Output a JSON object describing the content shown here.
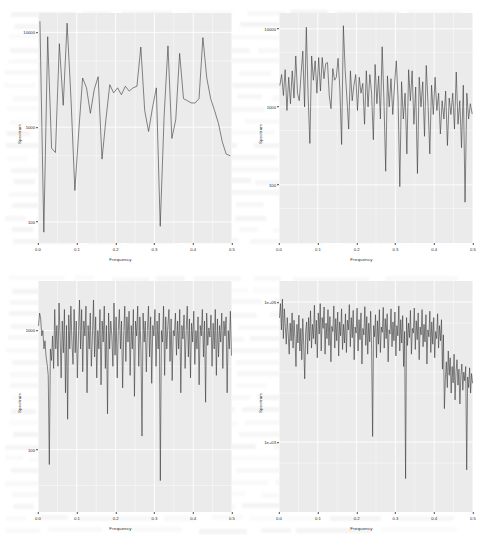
{
  "figure": {
    "kind": "spectrum-panel-grid",
    "rows": 2,
    "columns": 2,
    "page_background": "#ffffff",
    "panel_background": "#ebebeb",
    "gridline_color": "#ffffff",
    "series_color": "#3c3c3c",
    "axis_text_color": "#2b2b2b"
  },
  "chart_data": [
    {
      "id": "panel-top-left",
      "type": "line",
      "title": "",
      "xlabel": "Frequency",
      "ylabel": "Spectrum",
      "yscale": "log",
      "xlim": [
        0.0,
        0.5
      ],
      "ylim": [
        60,
        16000
      ],
      "grid": true,
      "legend": "none",
      "xticks": [
        "0.0",
        "0.1",
        "0.2",
        "0.3",
        "0.4",
        "0.5"
      ],
      "xtick_values": [
        0.0,
        0.1,
        0.2,
        0.3,
        0.4,
        0.5
      ],
      "yticks": [
        "10000",
        "1000",
        "100"
      ],
      "ytick_values": [
        10000,
        1000,
        100
      ],
      "x": [
        0.005,
        0.015,
        0.025,
        0.035,
        0.045,
        0.055,
        0.065,
        0.075,
        0.085,
        0.095,
        0.105,
        0.115,
        0.125,
        0.135,
        0.145,
        0.155,
        0.165,
        0.175,
        0.185,
        0.195,
        0.205,
        0.215,
        0.225,
        0.235,
        0.245,
        0.255,
        0.265,
        0.275,
        0.285,
        0.295,
        0.305,
        0.315,
        0.325,
        0.335,
        0.345,
        0.355,
        0.365,
        0.375,
        0.385,
        0.395,
        0.405,
        0.415,
        0.425,
        0.435,
        0.445,
        0.455,
        0.465,
        0.475,
        0.485,
        0.495
      ],
      "values": [
        13000,
        78,
        9000,
        600,
        540,
        7600,
        1700,
        12500,
        2000,
        215,
        900,
        3300,
        2600,
        1400,
        2500,
        3400,
        460,
        1200,
        2800,
        2300,
        2600,
        2200,
        2700,
        2400,
        2600,
        2700,
        7000,
        1500,
        900,
        1600,
        2600,
        90,
        1300,
        7200,
        760,
        1200,
        6000,
        2000,
        1900,
        1800,
        1800,
        2000,
        8800,
        3300,
        2000,
        1500,
        1100,
        700,
        520,
        500
      ]
    },
    {
      "id": "panel-top-right",
      "type": "line",
      "title": "",
      "xlabel": "Frequency",
      "ylabel": "Spectrum",
      "yscale": "log",
      "xlim": [
        0.0,
        0.5
      ],
      "ylim": [
        18,
        16000
      ],
      "grid": true,
      "legend": "none",
      "xticks": [
        "0.0",
        "0.1",
        "0.2",
        "0.3",
        "0.4",
        "0.5"
      ],
      "xtick_values": [
        0.0,
        0.1,
        0.2,
        0.3,
        0.4,
        0.5
      ],
      "yticks": [
        "10000",
        "1000",
        "100"
      ],
      "ytick_values": [
        10000,
        1000,
        100
      ],
      "n_points": 110,
      "trend": "declining power toward high frequency with deep narrow troughs",
      "values": [
        1900,
        2600,
        1400,
        3000,
        900,
        2400,
        1100,
        2900,
        1300,
        4500,
        1500,
        1200,
        2600,
        5200,
        1000,
        10500,
        1400,
        340,
        4500,
        2200,
        3900,
        1500,
        4300,
        1600,
        4300,
        2300,
        3600,
        3700,
        1400,
        950,
        3100,
        2200,
        2400,
        4200,
        1700,
        330,
        11000,
        3000,
        1300,
        520,
        2900,
        1200,
        1900,
        2600,
        900,
        2400,
        1500,
        2000,
        600,
        2900,
        1000,
        2600,
        1500,
        380,
        3500,
        1100,
        2500,
        700,
        5900,
        1200,
        150,
        2500,
        1000,
        2300,
        800,
        1900,
        3900,
        1300,
        95,
        2100,
        700,
        1500,
        250,
        3000,
        1200,
        2900,
        600,
        1800,
        140,
        2400,
        1000,
        2100,
        420,
        3400,
        1100,
        250,
        1900,
        800,
        2400,
        900,
        1500,
        450,
        1200,
        700,
        1600,
        320,
        1300,
        800,
        1500,
        520,
        2800,
        600,
        1200,
        300,
        1900,
        60,
        1500,
        700,
        1100,
        820
      ]
    },
    {
      "id": "panel-bottom-left",
      "type": "line",
      "title": "",
      "xlabel": "Frequency",
      "ylabel": "Spectrum",
      "yscale": "log",
      "xlim": [
        0.0,
        0.5
      ],
      "ylim": [
        30,
        2600
      ],
      "grid": true,
      "legend": "none",
      "xticks": [
        "0.0",
        "0.1",
        "0.2",
        "0.3",
        "0.4",
        "0.5"
      ],
      "xtick_values": [
        0.0,
        0.1,
        0.2,
        0.3,
        0.4,
        0.5
      ],
      "yticks": [
        "1000",
        "100"
      ],
      "ytick_values": [
        1000,
        100
      ],
      "n_points": 180,
      "trend": "broadly flat high-variance spectrum with several deep spikes",
      "values": [
        1100,
        1400,
        1250,
        900,
        1000,
        700,
        820,
        600,
        520,
        420,
        75,
        700,
        560,
        900,
        480,
        1500,
        700,
        1100,
        500,
        1700,
        900,
        400,
        1200,
        650,
        1500,
        300,
        1100,
        180,
        1350,
        700,
        1600,
        800,
        520,
        1500,
        650,
        1200,
        400,
        900,
        1800,
        700,
        1500,
        450,
        1200,
        900,
        1600,
        300,
        1100,
        700,
        1400,
        500,
        900,
        1800,
        600,
        1300,
        400,
        1000,
        700,
        1500,
        350,
        1200,
        800,
        1600,
        480,
        1100,
        200,
        1400,
        700,
        1200,
        900,
        500,
        1700,
        620,
        1300,
        400,
        1000,
        1500,
        700,
        1200,
        330,
        900,
        1600,
        550,
        1300,
        800,
        1450,
        420,
        1100,
        700,
        1500,
        280,
        1200,
        900,
        1600,
        500,
        1300,
        700,
        130,
        1400,
        800,
        1200,
        450,
        1000,
        1600,
        600,
        1300,
        360,
        1100,
        900,
        1500,
        500,
        1200,
        700,
        1400,
        55,
        1000,
        800,
        1600,
        420,
        1300,
        700,
        1100,
        1500,
        550,
        1250,
        380,
        1000,
        900,
        1400,
        620,
        1200,
        700,
        1500,
        300,
        1100,
        850,
        1350,
        480,
        1000,
        1600,
        600,
        1250,
        400,
        1150,
        800,
        1450,
        520,
        1000,
        700,
        1300,
        350,
        1100,
        900,
        1500,
        600,
        1200,
        250,
        1400,
        750,
        1050,
        880,
        1350,
        500,
        1150,
        700,
        1500,
        420,
        1250,
        600,
        1100,
        800,
        1400,
        480,
        1200,
        900,
        1300,
        300,
        1000,
        700,
        1450,
        620
      ]
    },
    {
      "id": "panel-bottom-right",
      "type": "line",
      "title": "",
      "xlabel": "Frequency",
      "ylabel": "Spectrum",
      "yscale": "log",
      "xlim": [
        0.0,
        0.5
      ],
      "ylim": [
        100,
        200000
      ],
      "grid": true,
      "legend": "none",
      "xticks": [
        "0.0",
        "0.1",
        "0.2",
        "0.3",
        "0.4",
        "0.5"
      ],
      "xtick_values": [
        0.0,
        0.1,
        0.2,
        0.3,
        0.4,
        0.5
      ],
      "yticks": [
        "1e+05",
        "1e+03"
      ],
      "ytick_values": [
        100000,
        1000
      ],
      "n_points": 200,
      "trend": "high power at low frequency, declining after 0.4 with deep spikes",
      "values": [
        60000,
        95000,
        40000,
        110000,
        30000,
        80000,
        45000,
        25000,
        60000,
        35000,
        18000,
        50000,
        28000,
        70000,
        22000,
        55000,
        30000,
        12000,
        48000,
        26000,
        65000,
        20000,
        42000,
        15000,
        58000,
        24000,
        8000,
        38000,
        52000,
        18000,
        60000,
        28000,
        75000,
        22000,
        48000,
        30000,
        90000,
        25000,
        55000,
        16000,
        70000,
        35000,
        95000,
        20000,
        60000,
        42000,
        85000,
        18000,
        50000,
        30000,
        78000,
        24000,
        62000,
        14000,
        45000,
        38000,
        88000,
        22000,
        58000,
        28000,
        72000,
        17000,
        52000,
        33000,
        80000,
        21000,
        48000,
        26000,
        68000,
        19000,
        55000,
        40000,
        92000,
        23000,
        60000,
        31000,
        76000,
        15000,
        44000,
        36000,
        82000,
        20000,
        56000,
        29000,
        70000,
        13000,
        42000,
        34000,
        86000,
        24000,
        62000,
        18000,
        50000,
        27000,
        74000,
        21000,
        1200,
        46000,
        32000,
        66000,
        16000,
        54000,
        25000,
        78000,
        19000,
        44000,
        37000,
        84000,
        22000,
        58000,
        30000,
        68000,
        14000,
        40000,
        35000,
        80000,
        23000,
        52000,
        28000,
        72000,
        17000,
        46000,
        33000,
        88000,
        20000,
        56000,
        26000,
        64000,
        12000,
        38000,
        300,
        60000,
        24000,
        50000,
        31000,
        76000,
        18000,
        42000,
        36000,
        82000,
        21000,
        54000,
        29000,
        70000,
        15000,
        44000,
        34000,
        78000,
        23000,
        48000,
        27000,
        66000,
        13000,
        40000,
        32000,
        74000,
        19000,
        52000,
        25000,
        60000,
        16000,
        38000,
        30000,
        68000,
        22000,
        46000,
        28000,
        56000,
        11000,
        34000,
        3000,
        8000,
        14000,
        6000,
        20000,
        9000,
        16000,
        5000,
        12000,
        7000,
        18000,
        4000,
        10000,
        15000,
        6500,
        11000,
        3500,
        9000,
        13000,
        5500,
        10000,
        7500,
        12000,
        400,
        8500,
        6000,
        11500,
        5000,
        9500,
        7000
      ]
    }
  ]
}
